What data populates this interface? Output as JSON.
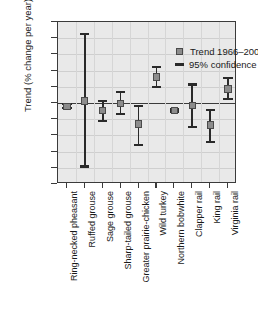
{
  "chart_data": {
    "type": "scatter",
    "title": "",
    "xlabel": "",
    "ylabel": "Trend (% change per year)",
    "ylim": [
      -25,
      25
    ],
    "yticks": [
      25,
      20,
      15,
      10,
      5,
      0,
      -5,
      -10,
      -15,
      -20,
      -25
    ],
    "grid": true,
    "legend_position": "top-right",
    "legend": [
      {
        "key": "trend",
        "label": "Trend 1966–2004",
        "marker": "square",
        "color": "#8c8c8c"
      },
      {
        "key": "ci",
        "label": "95% confidence limits",
        "marker": "line",
        "color": "#2a2a2a"
      }
    ],
    "categories": [
      "Ring-necked pheasant",
      "Ruffed grouse",
      "Sage grouse",
      "Sharp-tailed grouse",
      "Greater prairie-chicken",
      "Wild turkey",
      "Northern bobwhite",
      "Clapper rail",
      "King rail",
      "Virginia rail"
    ],
    "values": [
      -1.0,
      0.6,
      -2.2,
      -0.1,
      -6.5,
      8.0,
      -2.4,
      -0.8,
      -6.8,
      4.3
    ],
    "ci_lower": [
      -1.6,
      -19.6,
      -5.6,
      -3.5,
      -13.0,
      5.0,
      -2.8,
      -7.5,
      -12.0,
      1.2
    ],
    "ci_upper": [
      -0.3,
      21.2,
      0.7,
      3.4,
      -0.9,
      11.1,
      -2.0,
      5.7,
      -2.2,
      7.7
    ]
  },
  "axis": {
    "y_title": "Trend (% change per year)"
  }
}
